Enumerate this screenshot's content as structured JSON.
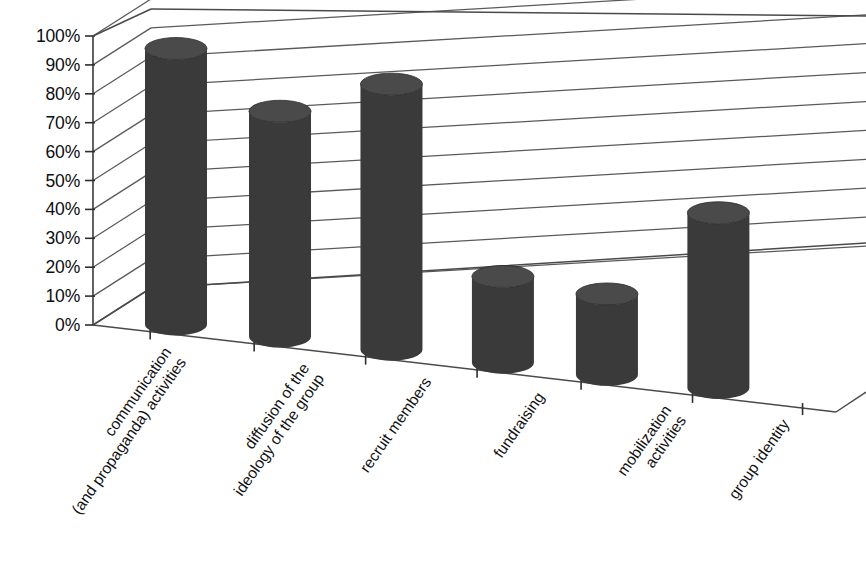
{
  "chart_data": {
    "type": "bar",
    "title": "",
    "subtitle": "",
    "xlabel": "",
    "ylabel": "",
    "ylim": [
      0,
      100
    ],
    "grid": true,
    "legend": null,
    "style": "3d-cylinder",
    "categories": [
      "communication (and propaganda) activities",
      "diffusion of the ideology of the group",
      "recruit members",
      "fundraising",
      "mobilization activities",
      "group identity"
    ],
    "category_lines": [
      [
        "communication",
        "(and propaganda) activities"
      ],
      [
        "diffusion of the",
        "ideology of the group"
      ],
      [
        "recruit members"
      ],
      [
        "fundraising"
      ],
      [
        "mobilization",
        "activities"
      ],
      [
        "group identity"
      ]
    ],
    "values": [
      95,
      77,
      90,
      29,
      27,
      58
    ],
    "value_labels": [
      "95%",
      "77%",
      "90%",
      "29%",
      "27%",
      "58%"
    ],
    "ytick_labels": [
      "100%",
      "90%",
      "80%",
      "70%",
      "60%",
      "50%",
      "40%",
      "30%",
      "20%",
      "10%",
      "0%"
    ],
    "ytick_values": [
      100,
      90,
      80,
      70,
      60,
      50,
      40,
      30,
      20,
      10,
      0
    ],
    "series_color": "#3a3a3a",
    "gridline_color": "#5a5a5a",
    "background_color": "#ffffff"
  },
  "colors": {
    "bar": "#3a3a3a",
    "bar_top": "#4a4a4a",
    "bar_shadow": "#2e2e2e",
    "grid": "#5a5a5a",
    "axis": "#3a3a3a",
    "text": "#111111",
    "background": "#ffffff"
  }
}
